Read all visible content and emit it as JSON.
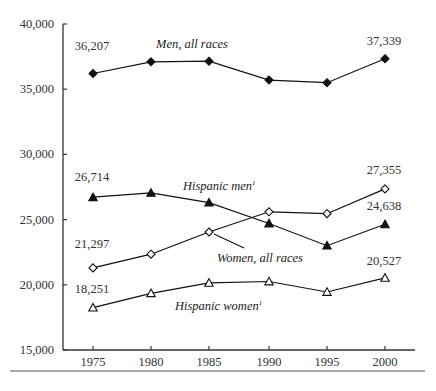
{
  "chart_data": {
    "type": "line",
    "title": "",
    "xlabel": "",
    "ylabel": "",
    "x": [
      1975,
      1980,
      1985,
      1990,
      1995,
      2000
    ],
    "x_tick_labels": [
      "1975",
      "1980",
      "1985",
      "1990",
      "1995",
      "2000"
    ],
    "y_tick_labels": [
      "15,000",
      "20,000",
      "25,000",
      "30,000",
      "35,000",
      "40,000"
    ],
    "y_ticks": [
      15000,
      20000,
      25000,
      30000,
      35000,
      40000
    ],
    "ylim": [
      15000,
      40000
    ],
    "grid": false,
    "legend": "inline labels",
    "series": [
      {
        "name": "Men, all races",
        "marker": "filled-diamond",
        "values": [
          36207,
          37100,
          37150,
          35700,
          35500,
          37339
        ],
        "labeled_points": {
          "start": "36,207",
          "end": "37,339"
        }
      },
      {
        "name": "Hispanic men",
        "footnote": "1",
        "marker": "filled-triangle",
        "values": [
          26714,
          27050,
          26300,
          24700,
          23000,
          24638
        ],
        "labeled_points": {
          "start": "26,714",
          "end": "24,638"
        }
      },
      {
        "name": "Women, all races",
        "marker": "open-diamond",
        "values": [
          21297,
          22350,
          24050,
          25600,
          25450,
          27355
        ],
        "labeled_points": {
          "start": "21,297",
          "end": "27,355"
        }
      },
      {
        "name": "Hispanic women",
        "footnote": "1",
        "marker": "open-triangle",
        "values": [
          18251,
          19350,
          20150,
          20250,
          19450,
          20527
        ],
        "labeled_points": {
          "start": "18,251",
          "end": "20,527"
        }
      }
    ]
  },
  "labels": {
    "men": "Men, all races",
    "hispanic_men": "Hispanic men",
    "women": "Women, all races",
    "hispanic_women": "Hispanic women",
    "footnote_mark": "1"
  }
}
